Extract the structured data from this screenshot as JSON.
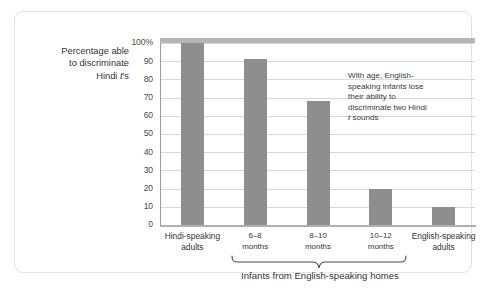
{
  "chart_data": {
    "type": "bar",
    "title": "",
    "ylabel_lines": [
      "Percentage able",
      "to discriminate",
      "Hindi t's"
    ],
    "ylabel_italic_token": "t",
    "xlabel": "",
    "categories": [
      {
        "line1": "Hindi-speaking",
        "line2": "adults"
      },
      {
        "line1": "6–8",
        "line2": "months"
      },
      {
        "line1": "8–10",
        "line2": "months"
      },
      {
        "line1": "10–12",
        "line2": "months"
      },
      {
        "line1": "English-speaking",
        "line2": "adults"
      }
    ],
    "values": [
      100,
      91,
      68,
      20,
      10
    ],
    "ylim": [
      0,
      100
    ],
    "yticks": [
      0,
      10,
      20,
      30,
      40,
      50,
      60,
      70,
      80,
      90,
      100
    ],
    "ytick_labels": [
      "0",
      "10",
      "20",
      "30",
      "40",
      "50",
      "60",
      "70",
      "80",
      "90",
      "100%"
    ],
    "grid": true,
    "legend": "none",
    "bar_color": "#8e8e8e",
    "gridline_color": "#d8d8d8",
    "axis_color": "#b0b0b0",
    "annotations": [
      {
        "name": "age-annotation",
        "lines": [
          "With age, English-",
          "speaking infants lose",
          "their ability to",
          "discriminate two Hindi",
          "t sounds"
        ],
        "italic_token": "t"
      }
    ],
    "group_bracket": {
      "caption": "Infants from English-speaking homes",
      "spans_categories": [
        "6–8 months",
        "8–10 months",
        "10–12 months"
      ]
    }
  }
}
